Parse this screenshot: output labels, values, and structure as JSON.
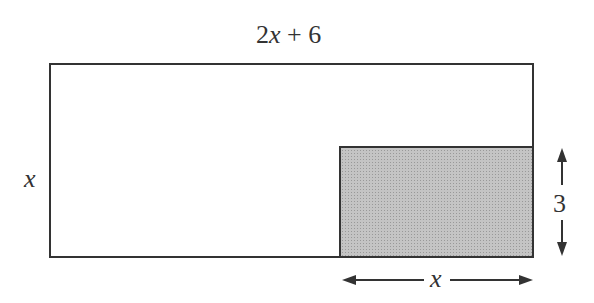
{
  "diagram": {
    "outer_rect": {
      "width_label_coef": "2",
      "width_label_var": "x",
      "width_label_rest": " + 6",
      "height_label": "x"
    },
    "shaded_rect": {
      "height_label": "3",
      "width_label": "x",
      "fill": "#b9b9b9"
    },
    "stroke_color": "#333333"
  }
}
